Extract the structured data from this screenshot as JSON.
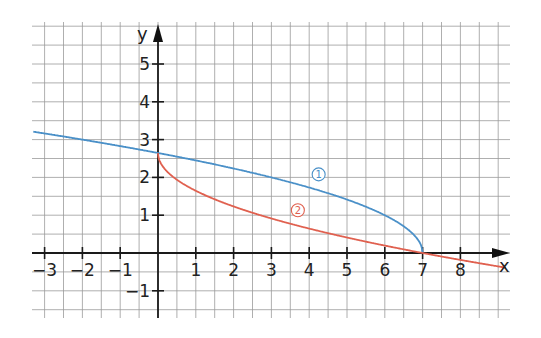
{
  "chart_data": {
    "type": "line",
    "title": "",
    "xlabel": "x",
    "ylabel": "y",
    "xlim": [
      -3.3,
      9.2
    ],
    "ylim": [
      -1.7,
      6.1
    ],
    "grid": true,
    "grid_step": 0.5,
    "x_ticks": [
      -3,
      -2,
      -1,
      1,
      2,
      3,
      4,
      5,
      6,
      7,
      8
    ],
    "x_tick_labels": [
      "−3",
      "−2",
      "−1",
      "1",
      "2",
      "3",
      "4",
      "5",
      "6",
      "7",
      "8"
    ],
    "y_ticks": [
      5,
      4,
      3,
      2,
      1,
      -1
    ],
    "y_tick_labels": [
      "5",
      "4",
      "3",
      "2",
      "1",
      "−1"
    ],
    "series": [
      {
        "name": "1",
        "color": "#4a90c8",
        "formula": "y = sqrt(7 - x)",
        "x": [
          -3.3,
          -3,
          -2,
          -1,
          0,
          1,
          2,
          3,
          4,
          5,
          6,
          6.5,
          6.9,
          7
        ],
        "y": [
          3.21,
          3.16,
          3.0,
          2.83,
          2.65,
          2.45,
          2.24,
          2.0,
          1.73,
          1.41,
          1.0,
          0.71,
          0.32,
          0
        ]
      },
      {
        "name": "2",
        "color": "#e0604f",
        "formula": "y = sqrt(7) - sqrt(x)",
        "x": [
          0,
          0.1,
          0.5,
          1,
          2,
          3,
          4,
          5,
          6,
          7,
          8,
          9.2
        ],
        "y": [
          2.65,
          2.33,
          1.94,
          1.65,
          1.23,
          0.91,
          0.65,
          0.41,
          0.2,
          0,
          -0.18,
          -0.39
        ]
      }
    ],
    "annotations": [
      {
        "label": "1",
        "x": 4.25,
        "y": 2.08,
        "color": "#4a90c8"
      },
      {
        "label": "2",
        "x": 3.7,
        "y": 1.13,
        "color": "#e0604f"
      }
    ]
  },
  "axes": {
    "x_name": "x",
    "y_name": "y"
  }
}
